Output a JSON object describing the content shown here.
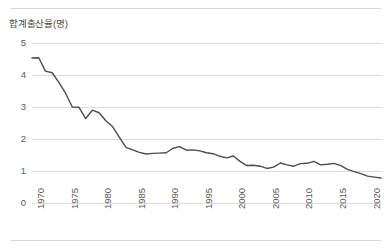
{
  "chart_data": {
    "type": "line",
    "title": "합계출산율(명)",
    "xlabel": "",
    "ylabel": "",
    "ylim": [
      0,
      5
    ],
    "xlim": [
      1970,
      2022
    ],
    "grid": true,
    "legend": false,
    "line_color": "#4d4d4d",
    "gridline_color": "#dcdcdc",
    "ytick_labels": [
      "5",
      "4",
      "3",
      "2",
      "1",
      "0"
    ],
    "ytick_values": [
      5,
      4,
      3,
      2,
      1,
      0
    ],
    "xtick_labels": [
      "1970",
      "1975",
      "1980",
      "1985",
      "1990",
      "1995",
      "2000",
      "2005",
      "2010",
      "2015",
      "2020"
    ],
    "xtick_values": [
      1970,
      1975,
      1980,
      1985,
      1990,
      1995,
      2000,
      2005,
      2010,
      2015,
      2020
    ],
    "x": [
      1970,
      1971,
      1972,
      1973,
      1974,
      1975,
      1976,
      1977,
      1978,
      1979,
      1980,
      1981,
      1982,
      1983,
      1984,
      1985,
      1986,
      1987,
      1988,
      1989,
      1990,
      1991,
      1992,
      1993,
      1994,
      1995,
      1996,
      1997,
      1998,
      1999,
      2000,
      2001,
      2002,
      2003,
      2004,
      2005,
      2006,
      2007,
      2008,
      2009,
      2010,
      2011,
      2012,
      2013,
      2014,
      2015,
      2016,
      2017,
      2018,
      2019,
      2020,
      2021,
      2022
    ],
    "values": [
      4.53,
      4.54,
      4.12,
      4.07,
      3.77,
      3.43,
      3.0,
      2.99,
      2.64,
      2.9,
      2.82,
      2.57,
      2.39,
      2.06,
      1.74,
      1.66,
      1.58,
      1.53,
      1.55,
      1.56,
      1.57,
      1.71,
      1.76,
      1.65,
      1.66,
      1.63,
      1.57,
      1.54,
      1.46,
      1.41,
      1.47,
      1.3,
      1.17,
      1.18,
      1.15,
      1.08,
      1.12,
      1.25,
      1.19,
      1.15,
      1.23,
      1.24,
      1.3,
      1.19,
      1.21,
      1.24,
      1.17,
      1.05,
      0.98,
      0.92,
      0.84,
      0.81,
      0.78
    ],
    "series_name": "합계출산율"
  },
  "figure": {
    "top_rule": "horizontal-divider",
    "bottom_rule": "horizontal-divider"
  }
}
